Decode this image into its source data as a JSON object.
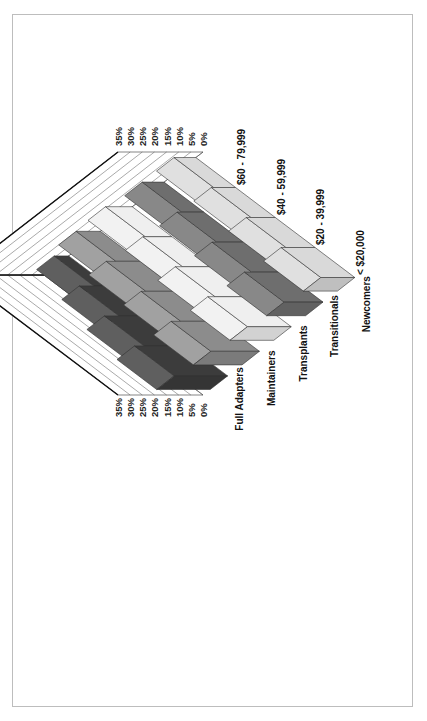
{
  "chart_data": {
    "type": "3d-ribbon",
    "orientation": "rotated-90-clockwise",
    "title": "",
    "categories": [
      "< $20,000",
      "$20 - 39,999",
      "$40 - 59,999",
      "$60 - 79,999"
    ],
    "series": [
      {
        "name": "Newcomers",
        "values": [
          14,
          12,
          10,
          9
        ],
        "color": "#d9d9d9"
      },
      {
        "name": "Transitionals",
        "values": [
          16,
          13,
          11,
          9
        ],
        "color": "#6e6e6e"
      },
      {
        "name": "Transplants",
        "values": [
          18,
          15,
          12,
          11
        ],
        "color": "#efefef"
      },
      {
        "name": "Maintainers",
        "values": [
          20,
          16,
          14,
          10
        ],
        "color": "#8c8c8c"
      },
      {
        "name": "Full Adapters",
        "values": [
          22,
          18,
          12,
          6
        ],
        "color": "#3c3c3c"
      }
    ],
    "value_axis": {
      "ticks": [
        "0%",
        "5%",
        "10%",
        "15%",
        "20%",
        "25%",
        "30%",
        "35%"
      ],
      "range": [
        0,
        35
      ],
      "unit": "%"
    },
    "xlabel": "",
    "ylabel": "",
    "grid": true,
    "legend": "none"
  }
}
